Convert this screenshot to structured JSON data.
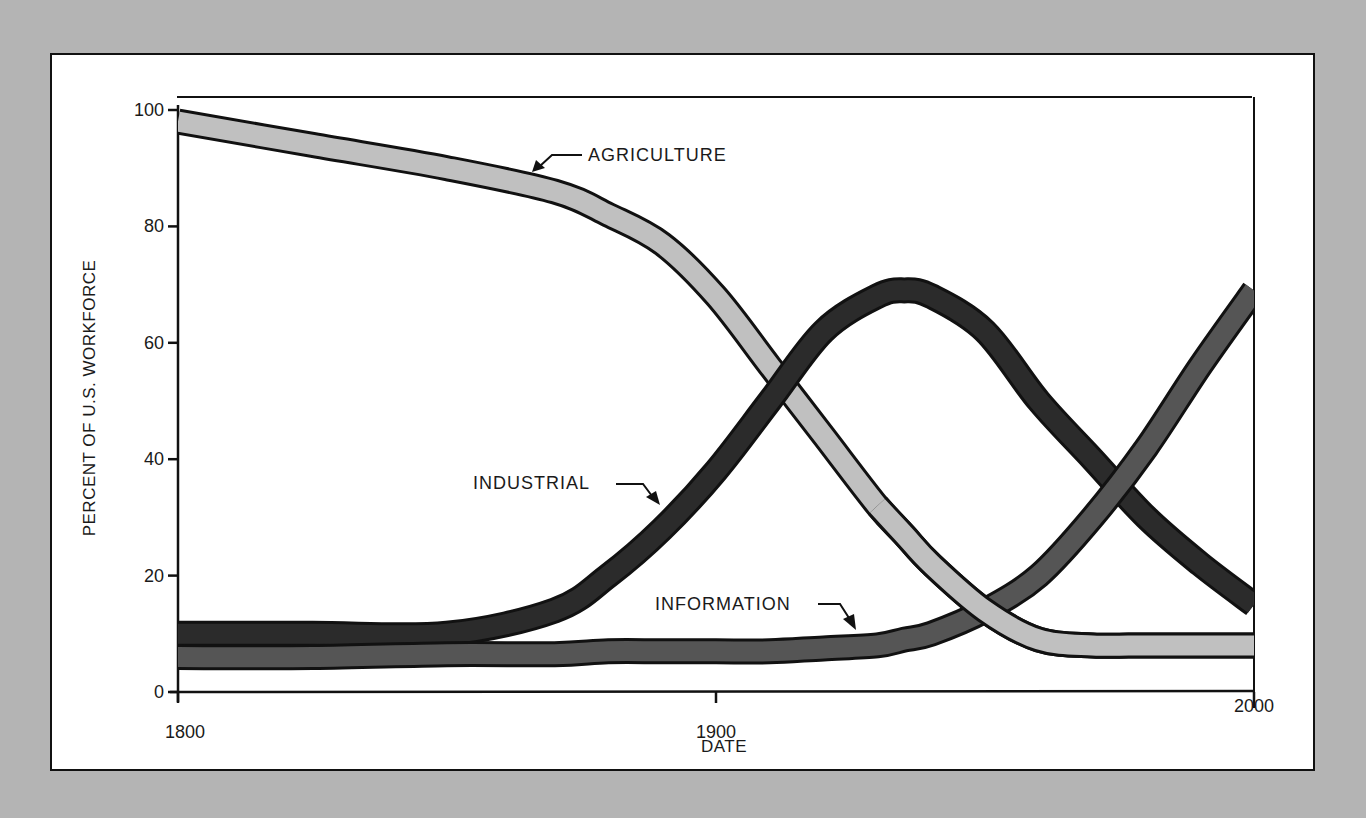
{
  "chart_data": {
    "type": "line",
    "title": "",
    "xlabel": "DATE",
    "ylabel": "PERCENT OF U.S. WORKFORCE",
    "xlim": [
      1800,
      2000
    ],
    "ylim": [
      0,
      100
    ],
    "grid": false,
    "legend": "inline annotations with arrows",
    "x_ticks": [
      "1800",
      "1900",
      "2000"
    ],
    "y_ticks": [
      "0",
      "20",
      "40",
      "60",
      "80",
      "100"
    ],
    "x": [
      1800,
      1825,
      1850,
      1870,
      1880,
      1890,
      1900,
      1910,
      1920,
      1930,
      1935,
      1940,
      1950,
      1960,
      1970,
      1980,
      1990,
      2000
    ],
    "series": [
      {
        "name": "AGRICULTURE",
        "color": "#c0c0c0",
        "values": [
          98,
          94,
          90,
          86,
          82,
          77,
          68,
          56,
          44,
          32,
          27,
          22,
          14,
          9,
          8,
          8,
          8,
          8
        ]
      },
      {
        "name": "INDUSTRIAL",
        "color": "#2b2b2b",
        "values": [
          10,
          10,
          10,
          14,
          20,
          28,
          38,
          50,
          62,
          68,
          69,
          68,
          62,
          50,
          40,
          30,
          22,
          15
        ]
      },
      {
        "name": "INFORMATION",
        "color": "#555555",
        "values": [
          6,
          6,
          6.5,
          6.5,
          7,
          7,
          7,
          7,
          7.5,
          8,
          9,
          10,
          14,
          20,
          30,
          42,
          56,
          69
        ]
      }
    ],
    "annotations": [
      {
        "text": "AGRICULTURE",
        "points_to": "agriculture band near 1870"
      },
      {
        "text": "INDUSTRIAL",
        "points_to": "industrial band near 1885"
      },
      {
        "text": "INFORMATION",
        "points_to": "information band near 1925"
      }
    ]
  },
  "labels": {
    "ylabel": "PERCENT OF U.S. WORKFORCE",
    "xlabel": "DATE",
    "y_ticks": [
      "0",
      "20",
      "40",
      "60",
      "80",
      "100"
    ],
    "x_ticks": [
      "1800",
      "1900",
      "2000"
    ],
    "agriculture": "AGRICULTURE",
    "industrial": "INDUSTRIAL",
    "information": "INFORMATION"
  }
}
